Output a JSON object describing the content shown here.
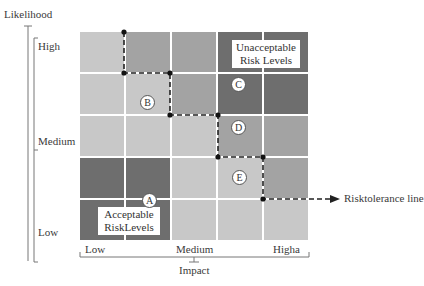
{
  "y_axis": {
    "title": "Likelihood",
    "ticks": [
      "High",
      "Medium",
      "Low"
    ]
  },
  "x_axis": {
    "title": "Impact",
    "ticks": [
      "Low",
      "Medium",
      "Higha"
    ]
  },
  "regions": {
    "unacceptable": "Unacceptable\nRisk Levels",
    "acceptable": "Acceptable\nRiskLevels"
  },
  "markers": [
    "A",
    "B",
    "C",
    "D",
    "E"
  ],
  "tolerance_label": "Risktolerance line",
  "colors": {
    "light": "#c8c8c8",
    "medium": "#a3a3a3",
    "dark": "#6e6e6e",
    "darkest": "#5a5a5a",
    "grid_gap": "#ffffff"
  },
  "grid": {
    "rows": 5,
    "cols": 5,
    "shades_top_to_bottom": [
      [
        "light",
        "medium",
        "medium",
        "dark",
        "dark"
      ],
      [
        "light",
        "light",
        "medium",
        "dark",
        "dark"
      ],
      [
        "light",
        "light",
        "light",
        "medium",
        "medium"
      ],
      [
        "dark",
        "dark",
        "light",
        "light",
        "medium"
      ],
      [
        "dark",
        "dark",
        "light",
        "light",
        "light"
      ]
    ]
  }
}
